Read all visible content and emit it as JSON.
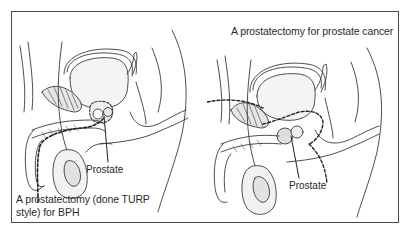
{
  "figure": {
    "panels": [
      {
        "id": "left",
        "caption": "A prostatectomy (done TURP style) for BPH",
        "label": "Prostate",
        "illustration": "sagittal-male-pelvis-turp"
      },
      {
        "id": "right",
        "caption": "A prostatectomy for prostate cancer",
        "label": "Prostate",
        "illustration": "sagittal-male-pelvis-radical"
      }
    ],
    "colors": {
      "frame": "#4a4a4a",
      "line": "#3a3a3a",
      "shade": "#e6e6e6",
      "text": "#2a2a2a"
    }
  }
}
